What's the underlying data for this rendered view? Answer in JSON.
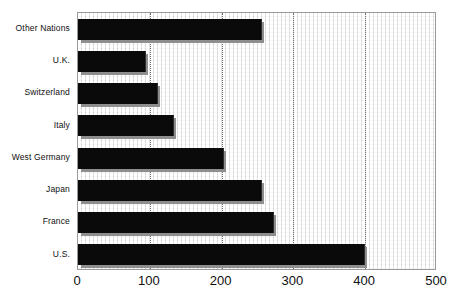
{
  "chart_data": {
    "type": "bar",
    "orientation": "horizontal",
    "title": "",
    "subtitle": "",
    "xlabel": "",
    "ylabel": "",
    "categories": [
      "Other Nations",
      "U.K.",
      "Switzerland",
      "Italy",
      "West Germany",
      "Japan",
      "France",
      "U.S."
    ],
    "values": [
      255,
      93,
      110,
      133,
      202,
      255,
      272,
      398
    ],
    "xlim": [
      0,
      500
    ],
    "xticks": [
      0,
      100,
      200,
      300,
      400,
      500
    ],
    "xtick_labels": [
      "0",
      "100",
      "200",
      "300",
      "400",
      "500"
    ],
    "gridlines": [
      100,
      200,
      300,
      400
    ],
    "grid": true,
    "legend": null,
    "legend_position": "none",
    "bar_color": "#0a0a0a",
    "bar_shadow_color": "#8e8e8e",
    "plot_background_color": "#f2f2f2",
    "frame_color": "#9a9a9a",
    "text_color": "#101010",
    "series": [
      {
        "name": "",
        "values": [
          255,
          93,
          110,
          133,
          202,
          255,
          272,
          398
        ]
      }
    ]
  }
}
